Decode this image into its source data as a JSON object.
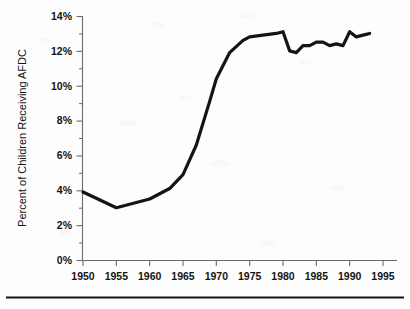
{
  "figure": {
    "background_color": "#fdfdfd",
    "line_color": "#141414",
    "axis_color": "#6b6b6b",
    "rule_color": "#141414"
  },
  "chart_data": {
    "type": "line",
    "title": "",
    "subtitle": "",
    "xlabel": "",
    "ylabel": "Percent of Children Receiving AFDC",
    "xlim": [
      1950,
      1995
    ],
    "ylim": [
      0,
      14
    ],
    "xticks": [
      1950,
      1955,
      1960,
      1965,
      1970,
      1975,
      1980,
      1985,
      1990,
      1995
    ],
    "xtick_labels": [
      "1950",
      "1955",
      "1960",
      "1965",
      "1970",
      "1975",
      "1980",
      "1985",
      "1990",
      "1995"
    ],
    "yticks": [
      0,
      2,
      4,
      6,
      8,
      10,
      12,
      14
    ],
    "ytick_labels": [
      "0%",
      "2%",
      "4%",
      "6%",
      "8%",
      "10%",
      "12%",
      "14%"
    ],
    "yminor_ticks": [
      1,
      3,
      5,
      7,
      9,
      11,
      13
    ],
    "grid": false,
    "legend": false,
    "legend_position": "none",
    "series": [
      {
        "name": "Percent of Children Receiving AFDC",
        "color": "#141414",
        "x": [
          1950,
          1955,
          1960,
          1963,
          1965,
          1967,
          1969,
          1970,
          1972,
          1974,
          1975,
          1977,
          1979,
          1980,
          1981,
          1982,
          1983,
          1984,
          1985,
          1986,
          1987,
          1988,
          1989,
          1990,
          1991,
          1992,
          1993
        ],
        "values": [
          3.9,
          3.0,
          3.5,
          4.1,
          4.9,
          6.6,
          9.1,
          10.4,
          11.9,
          12.6,
          12.8,
          12.9,
          13.0,
          13.1,
          12.0,
          11.9,
          12.3,
          12.3,
          12.5,
          12.5,
          12.3,
          12.4,
          12.3,
          13.1,
          12.8,
          12.9,
          13.0
        ]
      }
    ],
    "annotations": []
  },
  "axes": {
    "x_axis_name": "year-axis",
    "y_axis_name": "percent-axis"
  },
  "footer_rule": {
    "present": true
  }
}
